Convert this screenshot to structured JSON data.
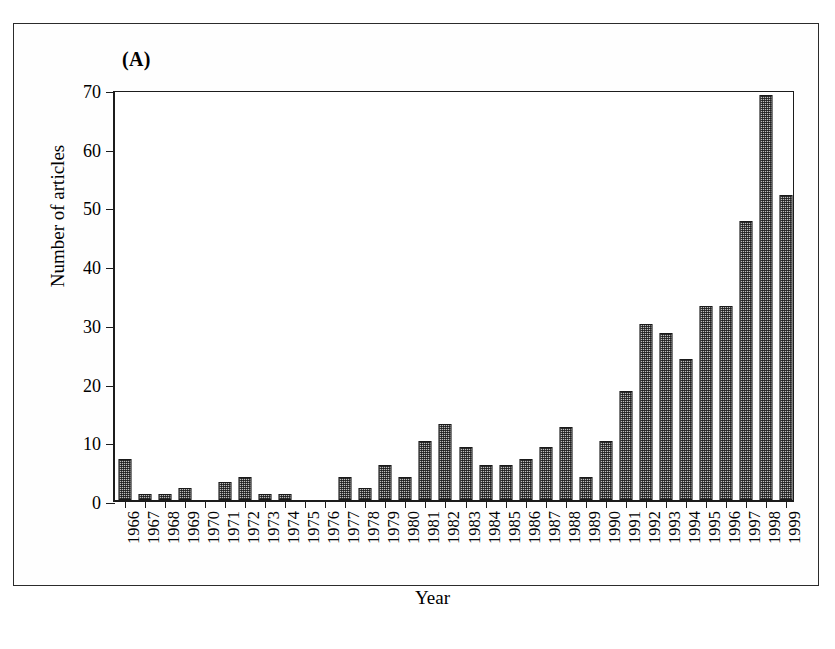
{
  "figure": {
    "panel_label": "(A)",
    "frame_visible": true
  },
  "chart_data": {
    "type": "bar",
    "title": "General Research (461 articles)",
    "xlabel": "Year",
    "ylabel": "Number of articles",
    "ylim": [
      0,
      70
    ],
    "yticks": [
      70,
      60,
      50,
      40,
      30,
      20,
      10,
      0
    ],
    "grid": false,
    "legend": "none",
    "total_articles": 461,
    "bar_fill_color": "#bdbdbd",
    "bar_edge_color": "#1a1a1a",
    "bar_pattern": "fine-checkerboard",
    "categories": [
      "1966",
      "1967",
      "1968",
      "1969",
      "1970",
      "1971",
      "1972",
      "1973",
      "1974",
      "1975",
      "1976",
      "1977",
      "1978",
      "1979",
      "1980",
      "1981",
      "1982",
      "1983",
      "1984",
      "1985",
      "1986",
      "1987",
      "1988",
      "1989",
      "1990",
      "1991",
      "1992",
      "1993",
      "1994",
      "1995",
      "1996",
      "1997",
      "1998",
      "1999"
    ],
    "values": [
      7,
      1,
      1,
      2,
      0,
      3,
      4,
      1,
      1,
      0,
      0,
      4,
      2,
      6,
      4,
      10,
      13,
      9,
      6,
      6,
      7,
      9,
      12.5,
      4,
      10,
      18.5,
      30,
      28.5,
      24,
      33,
      33,
      47.5,
      69,
      52
    ]
  }
}
